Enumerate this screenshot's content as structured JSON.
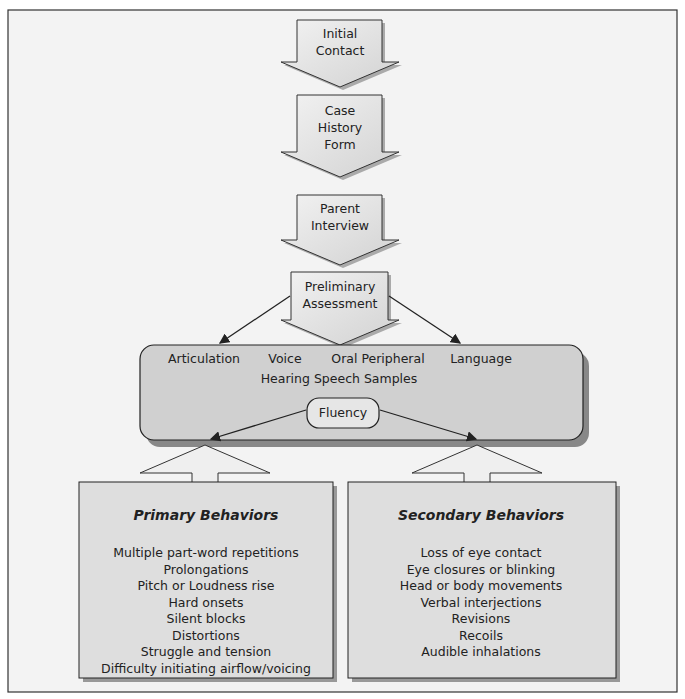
{
  "flow": {
    "step1": [
      "Initial",
      "Contact"
    ],
    "step2": [
      "Case",
      "History",
      "Form"
    ],
    "step3": [
      "Parent",
      "Interview"
    ],
    "step4": [
      "Preliminary",
      "Assessment"
    ]
  },
  "assessment": {
    "areas": [
      "Articulation",
      "Voice",
      "Oral Peripheral",
      "Language"
    ],
    "row2": "Hearing Speech Samples",
    "fluency": "Fluency"
  },
  "primary": {
    "title": "Primary Behaviors",
    "items": [
      "Multiple part-word repetitions",
      "Prolongations",
      "Pitch or Loudness rise",
      "Hard onsets",
      "Silent blocks",
      "Distortions",
      "Struggle and tension",
      "Difficulty initiating airflow/voicing"
    ]
  },
  "secondary": {
    "title": "Secondary Behaviors",
    "items": [
      "Loss of eye contact",
      "Eye closures or blinking",
      "Head or body movements",
      "Verbal interjections",
      "Revisions",
      "Recoils",
      "Audible inhalations"
    ]
  }
}
